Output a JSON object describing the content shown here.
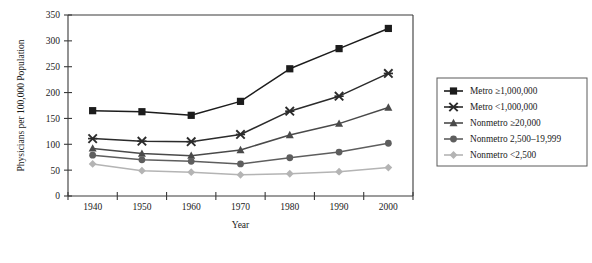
{
  "chart_data": {
    "type": "line",
    "title": "",
    "xlabel": "Year",
    "ylabel": "Physicians per 100,000 Population",
    "x": [
      1940,
      1950,
      1960,
      1970,
      1980,
      1990,
      2000
    ],
    "categories": [
      "1940",
      "1950",
      "1960",
      "1970",
      "1980",
      "1990",
      "2000"
    ],
    "xlim": [
      1935,
      2005
    ],
    "ylim": [
      0,
      350
    ],
    "yticks": [
      0,
      50,
      100,
      150,
      200,
      250,
      300,
      350
    ],
    "xticks": [
      "1940",
      "1950",
      "1960",
      "1970",
      "1980",
      "1990",
      "2000"
    ],
    "grid": false,
    "legend_position": "right",
    "series": [
      {
        "name": "Metro ≥1,000,000",
        "marker": "square",
        "color": "#1c1c1c",
        "values": [
          165,
          163,
          156,
          183,
          246,
          285,
          324
        ]
      },
      {
        "name": "Metro <1,000,000",
        "marker": "x-cross",
        "color": "#2b2b2b",
        "values": [
          111,
          106,
          105,
          119,
          164,
          193,
          237
        ]
      },
      {
        "name": "Nonmetro ≥20,000",
        "marker": "triangle",
        "color": "#4a4a4a",
        "values": [
          92,
          82,
          78,
          89,
          118,
          140,
          171
        ]
      },
      {
        "name": "Nonmetro 2,500–19,999",
        "marker": "circle",
        "color": "#5e5e5e",
        "values": [
          79,
          70,
          67,
          62,
          74,
          85,
          102
        ]
      },
      {
        "name": "Nonmetro <2,500",
        "marker": "diamond",
        "color": "#b4b4b4",
        "values": [
          62,
          49,
          46,
          41,
          43,
          47,
          55
        ]
      }
    ]
  },
  "legend": {
    "entries": [
      "Metro ≥1,000,000",
      "Metro <1,000,000",
      "Nonmetro ≥20,000",
      "Nonmetro 2,500–19,999",
      "Nonmetro <2,500"
    ]
  }
}
